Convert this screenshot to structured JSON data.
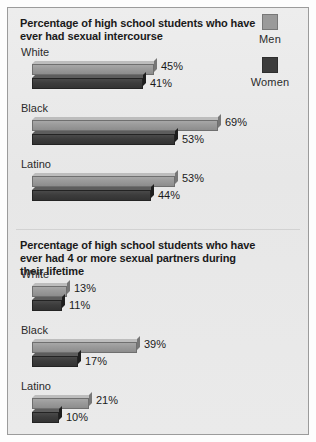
{
  "legend": {
    "entries": [
      {
        "label": "Men",
        "color": "#9a9a9a"
      },
      {
        "label": "Women",
        "color": "#3c3c3c"
      }
    ]
  },
  "chart_data": {
    "type": "bar",
    "title": "Percentage of high school students who have ever had sexual intercourse",
    "xlabel": "",
    "ylabel": "",
    "orientation": "horizontal",
    "grid": false,
    "legend_position": "top-right",
    "xlim": [
      0,
      100
    ],
    "charts": [
      {
        "title": "Percentage of high school students who have ever had sexual intercourse",
        "categories": [
          "White",
          "Black",
          "Latino"
        ],
        "series": [
          {
            "name": "Men",
            "values": [
              45,
              69,
              53
            ],
            "labels": [
              "45%",
              "69%",
              "53%"
            ]
          },
          {
            "name": "Women",
            "values": [
              41,
              53,
              44
            ],
            "labels": [
              "41%",
              "53%",
              "44%"
            ]
          }
        ]
      },
      {
        "title": "Percentage of high school students who have ever had 4 or more sexual partners during their lifetime",
        "categories": [
          "White",
          "Black",
          "Latino"
        ],
        "series": [
          {
            "name": "Men",
            "values": [
              13,
              39,
              21
            ],
            "labels": [
              "13%",
              "39%",
              "21%"
            ]
          },
          {
            "name": "Women",
            "values": [
              11,
              17,
              10
            ],
            "labels": [
              "11%",
              "17%",
              "10%"
            ]
          }
        ]
      }
    ]
  }
}
